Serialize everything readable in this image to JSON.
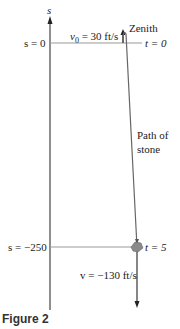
{
  "axis": {
    "label": "s"
  },
  "top": {
    "s_label": "s = 0",
    "v0_label": "v",
    "v0_sub": "0",
    "v0_value": " = 30 ft/s",
    "zenith_label": "Zenith",
    "t_label": "t = 0"
  },
  "path_label": {
    "line1": "Path of",
    "line2": "stone"
  },
  "bottom": {
    "s_label": "s = −250",
    "t_label": "t = 5",
    "v_label": "v = −130 ft/s"
  },
  "caption": "Figure 2",
  "colors": {
    "line": "#555555",
    "stone": "#888888",
    "grid": "#999999"
  }
}
